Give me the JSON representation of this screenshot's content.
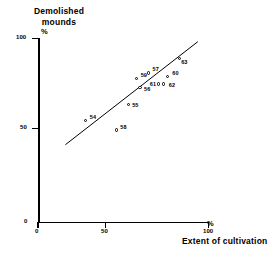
{
  "chart_data": {
    "type": "scatter",
    "title": "",
    "xlabel": "Extent of cultivation",
    "ylabel": "Demolished mounds",
    "x_unit": "%",
    "y_unit": "%",
    "xlim": [
      0,
      100
    ],
    "ylim": [
      0,
      100
    ],
    "xticks": [
      0,
      50,
      100
    ],
    "yticks": [
      0,
      50,
      100
    ],
    "xtick_labels": [
      "0",
      "50",
      "100"
    ],
    "ytick_labels": [
      "0",
      "50",
      "100"
    ],
    "grid": false,
    "legend": "none",
    "point_label_field": "year",
    "points": [
      {
        "label": "54",
        "x": 28,
        "y": 55
      },
      {
        "label": "58",
        "x": 46,
        "y": 50
      },
      {
        "label": "55",
        "x": 53,
        "y": 64
      },
      {
        "label": "59",
        "x": 58,
        "y": 78
      },
      {
        "label": "56",
        "x": 60,
        "y": 73
      },
      {
        "label": "57",
        "x": 65,
        "y": 81
      },
      {
        "label": "61",
        "x": 71,
        "y": 75
      },
      {
        "label": "62",
        "x": 74,
        "y": 75
      },
      {
        "label": "60",
        "x": 76,
        "y": 79
      },
      {
        "label": "63",
        "x": 83,
        "y": 89
      }
    ],
    "trendline": {
      "type": "linear-fit",
      "x_start": 16,
      "y_start": 42,
      "x_end": 94,
      "y_end": 98
    },
    "colors": {
      "axis": "#000000",
      "marker_stroke": "#000000",
      "marker_fill": "#ffffff",
      "trendline": "#000000",
      "background": "#ffffff"
    }
  },
  "axes": {
    "y": {
      "title": "Demolished\nmounds",
      "title_line1": "Demolished",
      "title_line2": "mounds",
      "unit": "%",
      "tick_100": "100",
      "tick_50": "50",
      "tick_0": "0"
    },
    "x": {
      "title": "Extent of cultivation",
      "unit": "%",
      "tick_0": "0",
      "tick_50": "50",
      "tick_100": "100"
    }
  }
}
